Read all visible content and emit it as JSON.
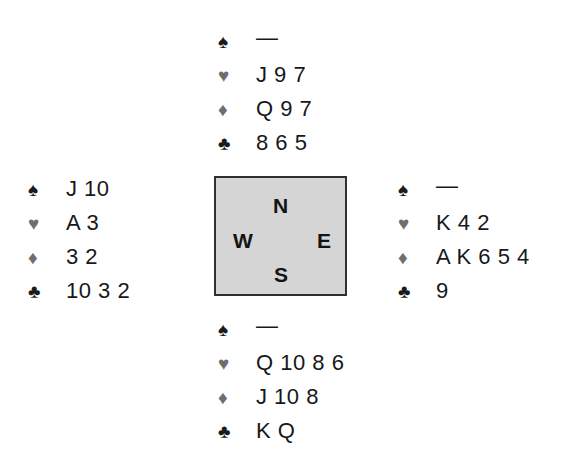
{
  "diagram": {
    "background_color": "#ffffff",
    "void_symbol": "—"
  },
  "suits": {
    "spade": {
      "glyph": "♠",
      "name": "spade",
      "color": "#1a1a1a",
      "tone": "black"
    },
    "heart": {
      "glyph": "♥",
      "name": "heart",
      "color": "#6e6e6e",
      "tone": "gray"
    },
    "diamond": {
      "glyph": "♦",
      "name": "diamond",
      "color": "#6e6e6e",
      "tone": "gray"
    },
    "club": {
      "glyph": "♣",
      "name": "club",
      "color": "#1a1a1a",
      "tone": "black"
    }
  },
  "compass": {
    "fill_color": "#d5d5d5",
    "border_color": "#2f3033",
    "north": "N",
    "west": "W",
    "east": "E",
    "south": "S"
  },
  "hands": {
    "north": {
      "position": "North",
      "spades": "—",
      "hearts": "J 9 7",
      "diamonds": "Q 9 7",
      "clubs": "8 6 5"
    },
    "west": {
      "position": "West",
      "spades": "J 10",
      "hearts": "A 3",
      "diamonds": "3 2",
      "clubs": "10 3 2"
    },
    "east": {
      "position": "East",
      "spades": "—",
      "hearts": "K 4 2",
      "diamonds": "A K 6 5 4",
      "clubs": "9"
    },
    "south": {
      "position": "South",
      "spades": "—",
      "hearts": "Q 10 8 6",
      "diamonds": "J 10 8",
      "clubs": "K Q"
    }
  }
}
